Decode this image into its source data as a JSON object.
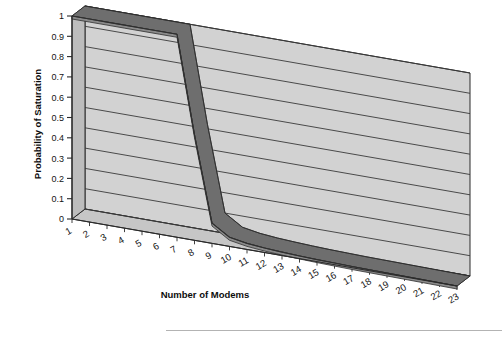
{
  "chart_data": {
    "type": "line",
    "title": "",
    "subtitle": "",
    "xlabel": "Number of Modems",
    "ylabel": "Probability of Saturation",
    "x": [
      1,
      2,
      3,
      4,
      5,
      6,
      7,
      8,
      9,
      10,
      11,
      12,
      13,
      14,
      15,
      16,
      17,
      18,
      19,
      20,
      21,
      22,
      23
    ],
    "categories": [
      "1",
      "2",
      "3",
      "4",
      "5",
      "6",
      "7",
      "8",
      "9",
      "10",
      "11",
      "12",
      "13",
      "14",
      "15",
      "16",
      "17",
      "18",
      "19",
      "20",
      "21",
      "22",
      "23"
    ],
    "values": [
      1.0,
      1.0,
      1.0,
      1.0,
      1.0,
      1.0,
      1.0,
      0.52,
      0.1,
      0.045,
      0.03,
      0.022,
      0.017,
      0.013,
      0.01,
      0.008,
      0.006,
      0.005,
      0.004,
      0.003,
      0.002,
      0.001,
      0.0
    ],
    "series": [
      {
        "name": "Probability of Saturation",
        "values": [
          1.0,
          1.0,
          1.0,
          1.0,
          1.0,
          1.0,
          1.0,
          0.52,
          0.1,
          0.045,
          0.03,
          0.022,
          0.017,
          0.013,
          0.01,
          0.008,
          0.006,
          0.005,
          0.004,
          0.003,
          0.002,
          0.001,
          0.0
        ]
      }
    ],
    "ylim": [
      0,
      1
    ],
    "ytick_labels": [
      "1",
      "0.9",
      "0.8",
      "0.7",
      "0.6",
      "0.5",
      "0.4",
      "0.3",
      "0.2",
      "0.1",
      "0"
    ],
    "ytick_values": [
      1,
      0.9,
      0.8,
      0.7,
      0.6,
      0.5,
      0.4,
      0.3,
      0.2,
      0.1,
      0
    ],
    "grid": true,
    "grid_axis": "y",
    "legend": false,
    "legend_position": "none",
    "projection": "3d",
    "xtick_rotation": -30,
    "colors": {
      "wall_fill": "#d2d2d2",
      "floor_fill": "#c6c6c6",
      "side_wall_fill": "#bdbdbd",
      "gridline": "#3a3a3a",
      "axis_line": "#2b2b2b",
      "series_line": "#6e6e6e",
      "series_edge": "#2f2f2f",
      "background": "#ffffff",
      "text": "#141414"
    }
  },
  "artifacts": {
    "scan_line_label": "scan-artifact-line"
  }
}
